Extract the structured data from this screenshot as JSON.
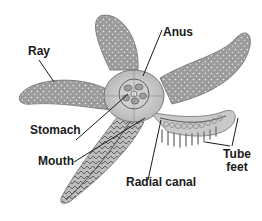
{
  "diagram": {
    "labels": {
      "ray": "Ray",
      "anus": "Anus",
      "stomach": "Stomach",
      "mouth": "Mouth",
      "radial_canal": "Radial canal",
      "tube_feet_line1": "Tube",
      "tube_feet_line2": "feet"
    },
    "colors": {
      "body": "#a9a9a9",
      "body_dark": "#7d7d7d",
      "body_light": "#d4d4d4",
      "dots": "#f2f2f2",
      "leader_line": "#1a1a1a",
      "text": "#1a1a1a"
    }
  }
}
